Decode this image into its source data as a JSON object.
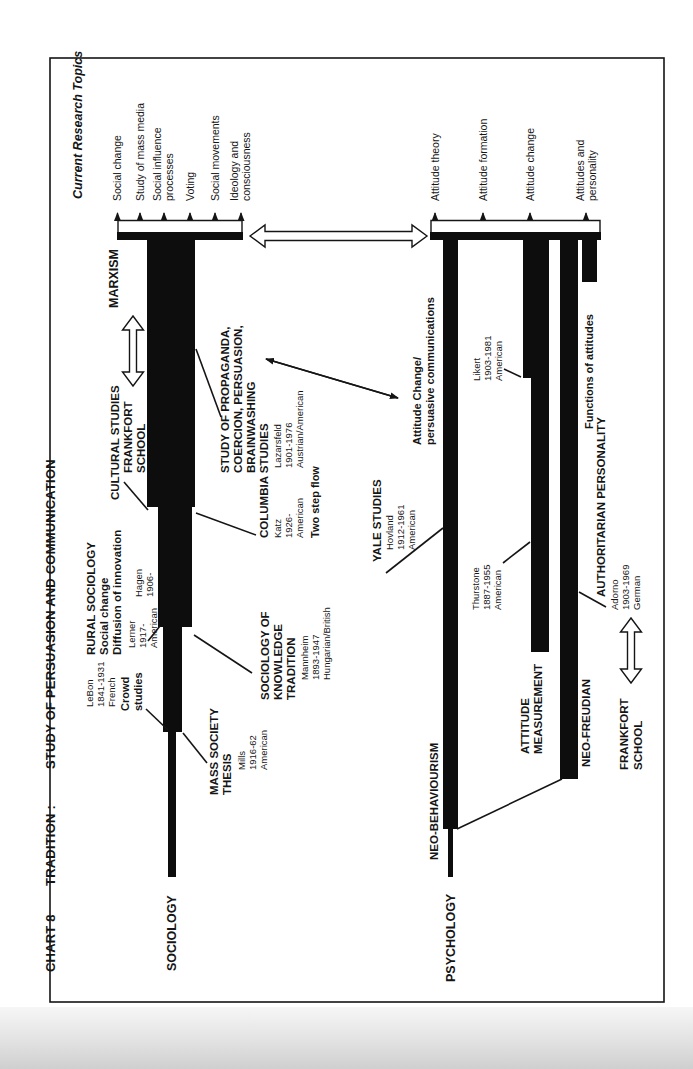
{
  "colors": {
    "paper": "#ffffff",
    "ink": "#151515",
    "band": "#d9d9d9"
  },
  "title": {
    "chart_no": "CHART 8",
    "tradition": "TRADITION :",
    "subject": "STUDY OF PERSUASION AND COMMUNICATION"
  },
  "current_research_topics": "Current Research Topics",
  "sociology": {
    "label": "SOCIOLOGY",
    "topics": [
      [
        "Social change"
      ],
      [
        "Study of mass media"
      ],
      [
        "Social influence",
        "processes"
      ],
      [
        "Voting"
      ],
      [
        "Social movements"
      ],
      [
        "Ideology and",
        "consciousness"
      ]
    ],
    "lebon": [
      "LeBon",
      "1841-1931",
      "French"
    ],
    "crowd": [
      "Crowd",
      "studies"
    ],
    "mass_society": [
      "MASS SOCIETY",
      "THESIS"
    ],
    "mills": [
      "Mills",
      "1916-62",
      "American"
    ],
    "rural": [
      "RURAL SOCIOLOGY",
      "Social change",
      "Diffusion of innovation"
    ],
    "lerner": [
      "Lerner",
      "1917-",
      "American"
    ],
    "hagen": [
      "Hagen",
      "1906-"
    ],
    "knowledge": [
      "SOCIOLOGY OF",
      "KNOWLEDGE",
      "TRADITION"
    ],
    "mannheim": [
      "Mannheim",
      "1893-1947",
      "Hungarian/British"
    ],
    "cultural": "CULTURAL STUDIES",
    "frankfort": [
      "FRANKFORT",
      "SCHOOL"
    ],
    "marxism": "MARXISM",
    "columbia": "COLUMBIA STUDIES",
    "katz": [
      "Katz",
      "1926-",
      "American"
    ],
    "lazarsfeld": [
      "Lazarsfeld",
      "1901-1976",
      "Austrian/American"
    ],
    "two_step": "Two step flow",
    "propaganda": [
      "STUDY OF PROPAGANDA,",
      "COERCION, PERSUASION,",
      "BRAINWASHING"
    ]
  },
  "psychology": {
    "label": "PSYCHOLOGY",
    "topics": [
      [
        "Attitude theory"
      ],
      [
        "Attitude formation"
      ],
      [
        "Attitude change"
      ],
      [
        "Attitudes and",
        "personality"
      ]
    ],
    "neo_behaviourism": "NEO-BEHAVIOURISM",
    "attitude_measurement": [
      "ATTITUDE",
      "MEASUREMENT"
    ],
    "thurstone": [
      "Thurstone",
      "1887-1955",
      "American"
    ],
    "neo_freudian": "NEO-FREUDIAN",
    "frankfort": [
      "FRANKFORT",
      "SCHOOL"
    ],
    "adorno": [
      "Adorno",
      "1903-1969",
      "German"
    ],
    "authoritarian": "AUTHORITARIAN PERSONALITY",
    "yale": "YALE STUDIES",
    "hovland": [
      "Hovland",
      "1912-1961",
      "American"
    ],
    "attitude_change": [
      "Attitude Change/",
      "persuasive communications"
    ],
    "likert": [
      "Likert",
      "1903-1981",
      "American"
    ],
    "functions": "Functions of attitudes"
  }
}
